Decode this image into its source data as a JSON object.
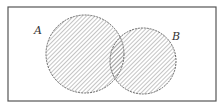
{
  "diagram": {
    "type": "venn",
    "universe": {
      "x": 8,
      "y": 7,
      "width": 208,
      "height": 94,
      "stroke": "#555555"
    },
    "sets": [
      {
        "label": "A",
        "cx": 85,
        "cy": 54,
        "r": 39,
        "label_x": 34,
        "label_y": 34
      },
      {
        "label": "B",
        "cx": 143,
        "cy": 61,
        "r": 33,
        "label_x": 172,
        "label_y": 40
      }
    ],
    "shading": "A ∪ B",
    "hatch_color": "#888888",
    "outline_color": "#666666"
  }
}
